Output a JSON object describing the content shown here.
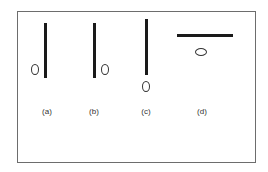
{
  "figure": {
    "panels": [
      {
        "id": "a",
        "label": "(a)",
        "bar_orientation": "vertical",
        "ellipse_position": "left of bar, near bottom"
      },
      {
        "id": "b",
        "label": "(b)",
        "bar_orientation": "vertical",
        "ellipse_position": "right of bar, near bottom"
      },
      {
        "id": "c",
        "label": "(c)",
        "bar_orientation": "vertical",
        "ellipse_position": "below bar"
      },
      {
        "id": "d",
        "label": "(d)",
        "bar_orientation": "horizontal",
        "ellipse_position": "below bar"
      }
    ]
  }
}
